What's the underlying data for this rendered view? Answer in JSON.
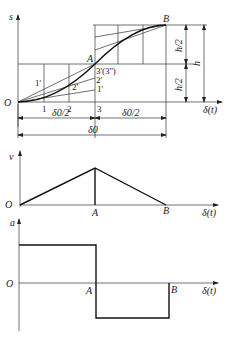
{
  "diagram": {
    "displacement_plot": {
      "y_axis_label": "s",
      "x_axis_label": "δ(t)",
      "origin_label": "O",
      "point_A": "A",
      "point_B": "B",
      "x_ticks": [
        "1",
        "2",
        "3"
      ],
      "construction_labels": [
        "1'",
        "2'",
        "3'(3'')",
        "2'",
        "1'"
      ],
      "label_3": "3'(3'')",
      "label_2p": "2'",
      "label_1p": "1'",
      "label_1p_left": "1'",
      "label_2p_curve": "2'",
      "dim_half_h_top": "h/2",
      "dim_half_h_bottom": "h/2",
      "dim_h": "h",
      "dim_half_delta_left": "δ0/2",
      "dim_half_delta_right": "δ0/2",
      "dim_delta0": "δ0"
    },
    "velocity_plot": {
      "y_axis_label": "v",
      "x_axis_label": "δ(t)",
      "origin_label": "O",
      "point_A": "A",
      "point_B": "B"
    },
    "acceleration_plot": {
      "y_axis_label": "a",
      "x_axis_label": "δ(t)",
      "origin_label": "O",
      "point_A": "A",
      "point_B": "B"
    }
  }
}
